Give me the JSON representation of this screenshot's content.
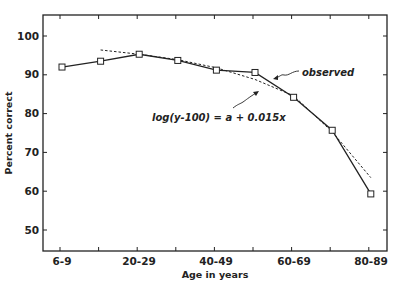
{
  "chart_data": {
    "type": "line",
    "title": "",
    "xlabel": "Age in years",
    "ylabel": "Percent correct",
    "x_tick_labels": [
      "6-9",
      "20-29",
      "40-49",
      "60-69",
      "80-89"
    ],
    "categories": [
      "6-9",
      "10-19",
      "20-29",
      "30-39",
      "40-49",
      "50-59",
      "60-69",
      "70-79",
      "80-89"
    ],
    "y_ticks": [
      50,
      60,
      70,
      80,
      90,
      100
    ],
    "ylim": [
      45,
      105
    ],
    "grid": false,
    "legend": "none",
    "series": [
      {
        "name": "observed",
        "style": "solid line with square markers",
        "values": [
          92.0,
          93.5,
          95.3,
          93.7,
          91.2,
          90.6,
          84.2,
          75.7,
          59.3
        ]
      },
      {
        "name": "log(y-100) = a + 0.015x",
        "style": "dashed fitted curve",
        "x_range": [
          "10-19",
          "80-89"
        ],
        "values": [
          97.1,
          96.4,
          95.3,
          93.9,
          91.8,
          88.8,
          84.6,
          75.3,
          63.5
        ]
      }
    ],
    "annotations": [
      {
        "text": "observed",
        "points_to": "observed line"
      },
      {
        "text": "log(y-100) = a + 0.015x",
        "points_to": "dashed fitted curve"
      }
    ]
  },
  "labels": {
    "xlabel": "Age in years",
    "ylabel": "Percent correct",
    "annot_observed": "observed",
    "annot_fit": "log(y-100) = a + 0.015x",
    "yticks": [
      "100",
      "90",
      "80",
      "70",
      "60",
      "50"
    ],
    "xticks": [
      "6-9",
      "20-29",
      "40-49",
      "60-69",
      "80-89"
    ]
  }
}
